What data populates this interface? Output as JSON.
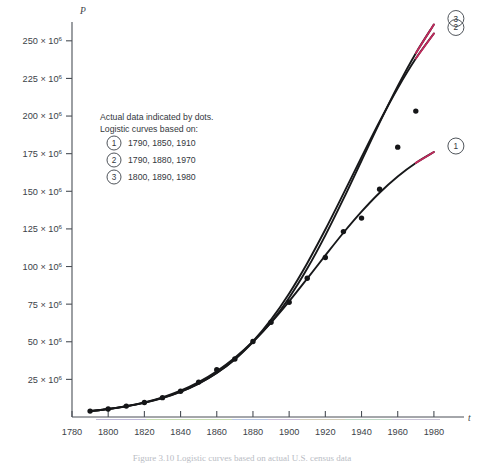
{
  "figure": {
    "caption": "Figure 3.10   Logistic curves based on actual U.S. census data",
    "y_axis_name": "P",
    "x_axis_name": "t"
  },
  "legend": {
    "line1": "Actual data indicated by dots.",
    "line2": "Logistic curves based on:",
    "entries": [
      {
        "badge": "1",
        "years": "1790, 1850, 1910"
      },
      {
        "badge": "2",
        "years": "1790, 1880, 1970"
      },
      {
        "badge": "3",
        "years": "1800, 1890, 1980"
      }
    ]
  },
  "curve_labels": [
    {
      "badge": "3"
    },
    {
      "badge": "2"
    },
    {
      "badge": "1"
    }
  ],
  "colors": {
    "axis": "#4a4f56",
    "curve": "#17181a",
    "curve_tail": "#c0295c",
    "dot": "#141517",
    "caption": "#b9bcc4"
  },
  "chart_data": {
    "type": "line",
    "title": "Figure 3.10   Logistic curves based on actual U.S. census data",
    "xlabel": "t",
    "ylabel": "P",
    "xlim": [
      1780,
      1990
    ],
    "ylim": [
      0,
      262500000
    ],
    "grid": false,
    "legend_position": "inside-upper-left",
    "y_tick_labels": [
      "25 × 10⁶",
      "50 × 10⁶",
      "75 × 10⁶",
      "100 × 10⁶",
      "125 × 10⁶",
      "150 × 10⁶",
      "175 × 10⁶",
      "200 × 10⁶",
      "225 × 10⁶",
      "250 × 10⁶"
    ],
    "y_tick_values": [
      25000000,
      50000000,
      75000000,
      100000000,
      125000000,
      150000000,
      175000000,
      200000000,
      225000000,
      250000000
    ],
    "x_tick_labels": [
      "1780",
      "1800",
      "1820",
      "1840",
      "1860",
      "1880",
      "1900",
      "1920",
      "1940",
      "1960",
      "1980"
    ],
    "x_tick_values": [
      1780,
      1800,
      1820,
      1840,
      1860,
      1880,
      1900,
      1920,
      1940,
      1960,
      1980
    ],
    "scatter": {
      "name": "Actual U.S. census data",
      "marker": "dot",
      "x": [
        1790,
        1800,
        1810,
        1820,
        1830,
        1840,
        1850,
        1860,
        1870,
        1880,
        1890,
        1900,
        1910,
        1920,
        1930,
        1940,
        1950,
        1960,
        1970
      ],
      "y": [
        3929000,
        5308000,
        7240000,
        9638000,
        12866000,
        17069000,
        23192000,
        31443000,
        38558000,
        50189000,
        62980000,
        76212000,
        92228000,
        106022000,
        123203000,
        132165000,
        151326000,
        179323000,
        203302000
      ]
    },
    "series": [
      {
        "name": "1",
        "badge": "1",
        "based_on_years": [
          1790,
          1850,
          1910
        ],
        "x": [
          1790,
          1800,
          1810,
          1820,
          1830,
          1840,
          1850,
          1860,
          1870,
          1880,
          1890,
          1900,
          1910,
          1920,
          1930,
          1940,
          1950,
          1960,
          1970,
          1980
        ],
        "y": [
          3929000,
          5336000,
          7228000,
          9757000,
          13108000,
          17506000,
          23192000,
          30412000,
          39372000,
          50177000,
          62766000,
          76870000,
          91972000,
          107394000,
          122441000,
          136489000,
          149063000,
          159876000,
          168846000,
          176088000
        ]
      },
      {
        "name": "2",
        "badge": "2",
        "based_on_years": [
          1790,
          1880,
          1970
        ],
        "x": [
          1790,
          1800,
          1810,
          1820,
          1830,
          1840,
          1850,
          1860,
          1870,
          1880,
          1890,
          1900,
          1910,
          1920,
          1930,
          1940,
          1950,
          1960,
          1970,
          1980
        ],
        "y": [
          3929000,
          5267000,
          7051000,
          9421000,
          12561000,
          16698000,
          22132000,
          29236000,
          38451000,
          50189000,
          64715000,
          82119000,
          102236000,
          124584000,
          148398000,
          172700000,
          196416000,
          218533000,
          238219000,
          254878000
        ]
      },
      {
        "name": "3",
        "badge": "3",
        "based_on_years": [
          1800,
          1890,
          1980
        ],
        "x": [
          1790,
          1800,
          1810,
          1820,
          1830,
          1840,
          1850,
          1860,
          1870,
          1880,
          1890,
          1900,
          1910,
          1920,
          1930,
          1940,
          1950,
          1960,
          1970,
          1980
        ],
        "y": [
          3948000,
          5308000,
          7119000,
          9517000,
          12676000,
          16816000,
          22218000,
          29230000,
          38239000,
          49749000,
          62980000,
          79300000,
          98656000,
          120739000,
          144923000,
          170281000,
          195651000,
          219833000,
          241788000,
          260830000
        ]
      }
    ]
  }
}
